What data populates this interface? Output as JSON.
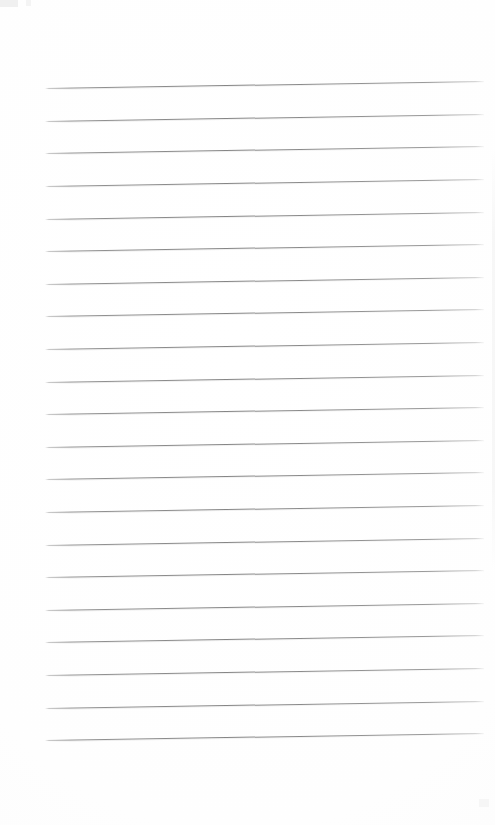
{
  "document": {
    "kind": "scanned-blank-ruled-notebook-page",
    "page_title": "",
    "body_text": "",
    "background_color": "#fefefe",
    "line_color": "#8e8e8e"
  },
  "ruling": {
    "line_count": 21,
    "first_line_y": 88,
    "line_spacing": 32.6,
    "line_left_x": 45,
    "line_right_x": 484,
    "line_thickness": 1,
    "skew_degrees": -0.92,
    "top_margin": 88,
    "bottom_margin": 85,
    "lines": [
      {
        "index": 1,
        "y": 88,
        "text": ""
      },
      {
        "index": 2,
        "y": 121,
        "text": ""
      },
      {
        "index": 3,
        "y": 153,
        "text": ""
      },
      {
        "index": 4,
        "y": 186,
        "text": ""
      },
      {
        "index": 5,
        "y": 219,
        "text": ""
      },
      {
        "index": 6,
        "y": 251,
        "text": ""
      },
      {
        "index": 7,
        "y": 284,
        "text": ""
      },
      {
        "index": 8,
        "y": 316,
        "text": ""
      },
      {
        "index": 9,
        "y": 349,
        "text": ""
      },
      {
        "index": 10,
        "y": 382,
        "text": ""
      },
      {
        "index": 11,
        "y": 414,
        "text": ""
      },
      {
        "index": 12,
        "y": 447,
        "text": ""
      },
      {
        "index": 13,
        "y": 479,
        "text": ""
      },
      {
        "index": 14,
        "y": 512,
        "text": ""
      },
      {
        "index": 15,
        "y": 545,
        "text": ""
      },
      {
        "index": 16,
        "y": 577,
        "text": ""
      },
      {
        "index": 17,
        "y": 610,
        "text": ""
      },
      {
        "index": 18,
        "y": 642,
        "text": ""
      },
      {
        "index": 19,
        "y": 675,
        "text": ""
      },
      {
        "index": 20,
        "y": 708,
        "text": ""
      },
      {
        "index": 21,
        "y": 740,
        "text": ""
      }
    ]
  },
  "artifacts": [
    {
      "name": "corner-block",
      "x": 0,
      "y": 0,
      "w": 18,
      "h": 7
    },
    {
      "name": "corner-speck",
      "x": 26,
      "y": 0,
      "w": 5,
      "h": 6
    },
    {
      "name": "right-edge",
      "x": 492,
      "y": 150,
      "w": 3,
      "h": 420
    },
    {
      "name": "bottom-right",
      "x": 479,
      "y": 799,
      "w": 10,
      "h": 8
    }
  ]
}
